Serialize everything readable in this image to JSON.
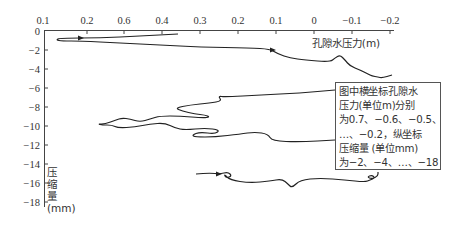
{
  "chart_data": {
    "type": "line",
    "title": "",
    "xlabel": "孔隙水压力(m)",
    "ylabel": [
      "压",
      "缩",
      "量",
      "(mm)"
    ],
    "x_axis_position": "top",
    "x_tick_labels": [
      "0.1",
      "0.2",
      "0.6",
      "0.4",
      "0.3",
      "0.2",
      "0.1",
      "0",
      "−0.1",
      "−0.2"
    ],
    "x_tick_px": [
      43,
      87,
      124,
      162,
      200,
      238,
      276,
      314,
      352,
      390
    ],
    "y_tick_labels": [
      "0",
      "−2",
      "−4",
      "−6",
      "−8",
      "−10",
      "−12",
      "−14",
      "−16",
      "−18"
    ],
    "y_tick_px": [
      31,
      50,
      69,
      88,
      107,
      126,
      145,
      164,
      183,
      202
    ],
    "ylim": [
      -18,
      0
    ],
    "grid": false,
    "legend": null,
    "annotation": [
      "图中横坐标孔隙水",
      "压力(单位m)分别",
      "为0.7、−0.6、−0.5、",
      "…、−0.2，纵坐标",
      "压缩量 (单位mm)",
      "为−2、−4、…、−18"
    ],
    "series": [
      {
        "name": "loading-path-upper",
        "description": "Starts near 0.2 at 0 mm, loops back to ~0.15, then runs right with arrow to about 0.1 at −1 mm, descends to −5 mm near −0.15 with small loops",
        "points_px": [
          [
            178,
            34
          ],
          [
            140,
            36
          ],
          [
            100,
            38
          ],
          [
            60,
            38
          ],
          [
            56,
            40
          ],
          [
            62,
            41
          ],
          [
            80,
            41
          ],
          [
            120,
            43
          ],
          [
            160,
            45
          ],
          [
            200,
            47
          ],
          [
            250,
            48
          ],
          [
            270,
            49
          ],
          [
            278,
            54
          ],
          [
            290,
            58
          ],
          [
            305,
            60
          ],
          [
            330,
            62
          ],
          [
            335,
            58
          ],
          [
            340,
            55
          ],
          [
            345,
            60
          ],
          [
            350,
            66
          ],
          [
            360,
            70
          ],
          [
            368,
            74
          ],
          [
            372,
            76
          ],
          [
            378,
            77
          ],
          [
            382,
            78
          ],
          [
            392,
            75
          ]
        ]
      },
      {
        "name": "middle-tangle",
        "description": "Wavy trajectory between −6 and −11 mm with several small loops around x≈0.5–0.3",
        "points_px": [
          [
            335,
            90
          ],
          [
            300,
            93
          ],
          [
            260,
            95
          ],
          [
            225,
            97
          ],
          [
            218,
            96
          ],
          [
            222,
            101
          ],
          [
            210,
            103
          ],
          [
            190,
            105
          ],
          [
            175,
            108
          ],
          [
            182,
            111
          ],
          [
            195,
            114
          ],
          [
            205,
            115
          ],
          [
            210,
            117
          ],
          [
            203,
            118
          ],
          [
            180,
            116
          ],
          [
            160,
            116
          ],
          [
            150,
            119
          ],
          [
            140,
            122
          ],
          [
            130,
            119
          ],
          [
            122,
            118
          ],
          [
            116,
            120
          ],
          [
            105,
            124
          ],
          [
            98,
            124
          ],
          [
            102,
            125
          ],
          [
            112,
            125
          ],
          [
            118,
            128
          ],
          [
            135,
            127
          ],
          [
            150,
            124
          ],
          [
            165,
            123
          ],
          [
            175,
            128
          ],
          [
            185,
            130
          ],
          [
            205,
            128
          ],
          [
            220,
            130
          ],
          [
            215,
            134
          ],
          [
            200,
            132
          ],
          [
            192,
            135
          ],
          [
            195,
            137
          ],
          [
            215,
            137
          ],
          [
            240,
            134
          ],
          [
            255,
            132
          ],
          [
            268,
            134
          ],
          [
            272,
            141
          ],
          [
            300,
            142
          ],
          [
            335,
            140
          ]
        ]
      },
      {
        "name": "bottom-path",
        "description": "Lower trace near −16 mm from ~0.25 to ~−0.15 with arrow and loops at both ends",
        "points_px": [
          [
            196,
            174
          ],
          [
            210,
            173
          ],
          [
            220,
            174
          ],
          [
            228,
            172
          ],
          [
            232,
            176
          ],
          [
            226,
            178
          ],
          [
            224,
            174
          ],
          [
            230,
            180
          ],
          [
            250,
            183
          ],
          [
            270,
            181
          ],
          [
            282,
            179
          ],
          [
            288,
            184
          ],
          [
            292,
            188
          ],
          [
            300,
            180
          ],
          [
            320,
            178
          ],
          [
            345,
            180
          ],
          [
            365,
            182
          ],
          [
            370,
            180
          ],
          [
            375,
            178
          ],
          [
            372,
            175
          ],
          [
            367,
            177
          ],
          [
            372,
            179
          ],
          [
            378,
            176
          ],
          [
            378,
            172
          ]
        ]
      }
    ]
  }
}
